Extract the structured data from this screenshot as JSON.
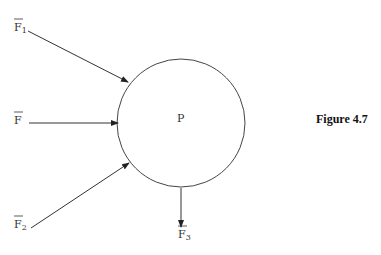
{
  "diagram": {
    "center_label": "P",
    "forces": [
      {
        "name": "F",
        "subscript": "1"
      },
      {
        "name": "F",
        "subscript": ""
      },
      {
        "name": "F",
        "subscript": "2"
      },
      {
        "name": "F",
        "subscript": "3"
      }
    ]
  },
  "caption": "Figure 4.7"
}
